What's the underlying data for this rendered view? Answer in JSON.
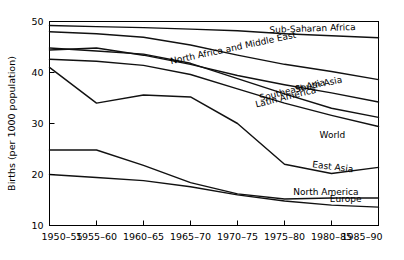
{
  "chart_data": {
    "type": "line",
    "title": "",
    "xlabel": "",
    "ylabel": "Births (per 1000 population)",
    "categories": [
      "1950–55",
      "1955–60",
      "1960–65",
      "1965–70",
      "1970–75",
      "1975–80",
      "1980–85",
      "1985–90"
    ],
    "ylim": [
      10,
      50
    ],
    "yticks": [
      10,
      20,
      30,
      40,
      50
    ],
    "ytick_labels": [
      "10",
      "20",
      "30",
      "40",
      "50"
    ],
    "grid": false,
    "legend_position": "inline-right",
    "band": {
      "name": "World",
      "color": "#d8d8d8",
      "upper": [
        38.0,
        36.0,
        36.2,
        36.4,
        34.6,
        30.6,
        29.6,
        28.2
      ],
      "lower": [
        10,
        10,
        10,
        10,
        10,
        10,
        10,
        10
      ]
    },
    "series": [
      {
        "name": "Sub-Saharan Africa",
        "values": [
          49.2,
          49.0,
          48.8,
          48.5,
          48.2,
          47.6,
          47.2,
          46.8
        ],
        "label_x": 0.8,
        "label_angle": -2
      },
      {
        "name": "North Africa and Middle East",
        "values": [
          48.0,
          47.6,
          46.9,
          45.4,
          43.4,
          41.6,
          40.2,
          38.6
        ],
        "label_x": 0.56,
        "label_angle": -12
      },
      {
        "name": "South Asia",
        "values": [
          44.4,
          44.8,
          43.4,
          41.6,
          39.4,
          37.6,
          36.0,
          34.2
        ],
        "label_x": 0.82,
        "label_angle": -12
      },
      {
        "name": "Southeast Asia",
        "values": [
          44.8,
          44.2,
          43.6,
          41.8,
          38.8,
          35.8,
          33.0,
          31.2
        ],
        "label_x": 0.74,
        "label_angle": -14
      },
      {
        "name": "Latin America",
        "values": [
          42.6,
          42.2,
          41.4,
          39.6,
          36.8,
          34.0,
          31.6,
          29.4
        ],
        "label_x": 0.72,
        "label_angle": -14
      },
      {
        "name": "East Asia",
        "values": [
          41.0,
          34.0,
          35.6,
          35.2,
          30.0,
          22.0,
          20.2,
          21.4
        ],
        "label_x": 0.86,
        "label_angle": 7
      },
      {
        "name": "North America",
        "values": [
          24.8,
          24.8,
          21.8,
          18.4,
          16.2,
          15.2,
          15.4,
          15.4
        ],
        "label_x": 0.84,
        "label_angle": 0
      },
      {
        "name": "Europe",
        "values": [
          20.0,
          19.4,
          18.8,
          17.6,
          16.0,
          14.8,
          14.0,
          13.6
        ],
        "label_x": 0.9,
        "label_angle": 0
      }
    ]
  },
  "axis": {
    "y_title": "Births (per 1000 population)"
  }
}
